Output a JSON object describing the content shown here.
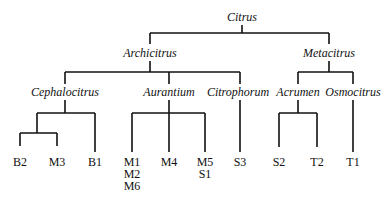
{
  "diagram": {
    "type": "tree",
    "root": {
      "label": "Citrus",
      "children": [
        {
          "label": "Archicitrus",
          "children": [
            {
              "label": "Cephalocitrus",
              "children": [
                {
                  "group": true,
                  "children": [
                    {
                      "label": "B2"
                    },
                    {
                      "label": "M3"
                    }
                  ]
                },
                {
                  "label": "B1"
                }
              ]
            },
            {
              "label": "Aurantium",
              "children": [
                {
                  "label": "M1 M2 M6",
                  "lines": [
                    "M1",
                    "M2",
                    "M6"
                  ]
                },
                {
                  "label": "M4",
                  "lines": [
                    "M4"
                  ]
                },
                {
                  "label": "M5 S1",
                  "lines": [
                    "M5",
                    "S1"
                  ]
                }
              ]
            },
            {
              "label": "Citrophorum",
              "children": [
                {
                  "label": "S3"
                }
              ]
            }
          ]
        },
        {
          "label": "Metacitrus",
          "children": [
            {
              "label": "Acrumen",
              "children": [
                {
                  "label": "S2"
                },
                {
                  "label": "T2"
                }
              ]
            },
            {
              "label": "Osmocitrus",
              "children": [
                {
                  "label": "T1"
                }
              ]
            }
          ]
        }
      ]
    }
  },
  "labels": {
    "citrus": "Citrus",
    "archicitrus": "Archicitrus",
    "metacitrus": "Metacitrus",
    "cephalocitrus": "Cephalocitrus",
    "aurantium": "Aurantium",
    "citrophorum": "Citrophorum",
    "acrumen": "Acrumen",
    "osmocitrus": "Osmocitrus",
    "leaves": {
      "b2": "B2",
      "m3": "M3",
      "b1": "B1",
      "m1": "M1",
      "m2": "M2",
      "m6": "M6",
      "m4": "M4",
      "m5": "M5",
      "s1": "S1",
      "s3": "S3",
      "s2": "S2",
      "t2": "T2",
      "t1": "T1"
    }
  }
}
